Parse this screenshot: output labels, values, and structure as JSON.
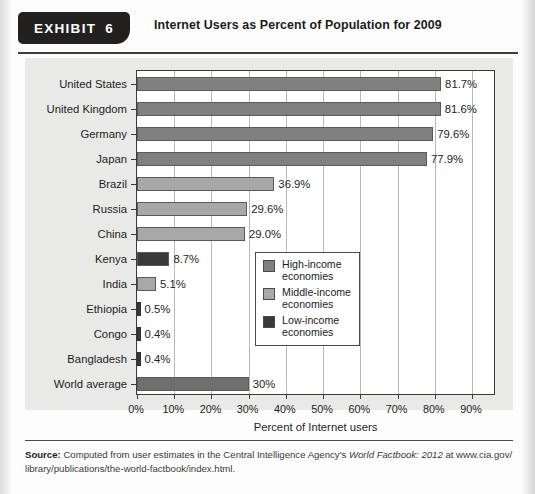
{
  "exhibit": {
    "badge_label": "EXHIBIT",
    "badge_number": "6",
    "title": "Internet Users as Percent of Population for 2009"
  },
  "colors": {
    "high_income": "#808080",
    "middle_income": "#a8a8a8",
    "low_income": "#3a3a3a",
    "world_average": "#6e6e6e",
    "panel_background": "#e9e9e7",
    "plot_background": "#ffffff",
    "axis": "#3b3b3b",
    "gridline": "#b9b9b9",
    "badge_background": "#221f1f"
  },
  "chart_data": {
    "type": "bar",
    "orientation": "horizontal",
    "title": "Internet Users as Percent of Population for 2009",
    "xlabel": "Percent of Internet users",
    "ylabel": "",
    "xlim": [
      0,
      90
    ],
    "xticks": [
      "0%",
      "10%",
      "20%",
      "30%",
      "40%",
      "50%",
      "60%",
      "70%",
      "80%",
      "90%"
    ],
    "xtick_values": [
      0,
      10,
      20,
      30,
      40,
      50,
      60,
      70,
      80,
      90
    ],
    "grid": "vertical",
    "legend_position": "inside-lower-right",
    "categories": [
      "United States",
      "United Kingdom",
      "Germany",
      "Japan",
      "Brazil",
      "Russia",
      "China",
      "Kenya",
      "India",
      "Ethiopia",
      "Congo",
      "Bangladesh",
      "World average"
    ],
    "values": [
      81.7,
      81.6,
      79.6,
      77.9,
      36.9,
      29.6,
      29.0,
      8.7,
      5.1,
      0.5,
      0.4,
      0.4,
      30.0
    ],
    "value_labels": [
      "81.7%",
      "81.6%",
      "79.6%",
      "77.9%",
      "36.9%",
      "29.6%",
      "29.0%",
      "8.7%",
      "5.1%",
      "0.5%",
      "0.4%",
      "0.4%",
      "30%"
    ],
    "groups": [
      "high_income",
      "high_income",
      "high_income",
      "high_income",
      "middle_income",
      "middle_income",
      "middle_income",
      "low_income",
      "middle_income",
      "low_income",
      "low_income",
      "low_income",
      "world_average"
    ],
    "legend": [
      {
        "label": "High-income\neconomies",
        "group": "high_income"
      },
      {
        "label": "Middle-income\neconomies",
        "group": "middle_income"
      },
      {
        "label": "Low-income\neconomies",
        "group": "low_income"
      }
    ]
  },
  "source": {
    "label": "Source:",
    "line1_a": " Computed from user estimates in the Central Intelligence Agency's ",
    "line1_italic": "World Factbook: 2012",
    "line1_b": " at www.cia.gov/",
    "line2": "library/publications/the-world-factbook/index.html."
  }
}
